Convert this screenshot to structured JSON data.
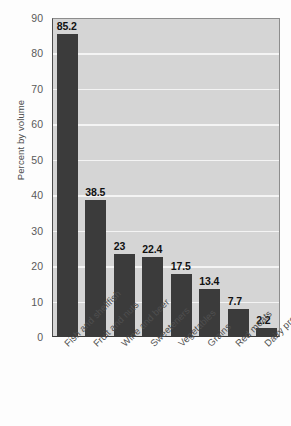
{
  "chart_data": {
    "type": "bar",
    "title": "",
    "xlabel": "",
    "ylabel": "Percent by volume",
    "ylim": [
      0,
      90
    ],
    "ytick_step": 10,
    "yticks": [
      90,
      80,
      70,
      60,
      50,
      40,
      30,
      20,
      10,
      0
    ],
    "grid": true,
    "legend": "none",
    "orientation": "vertical",
    "categories": [
      "Fish and shellfish",
      "Fruit and nuts",
      "Wine and beer",
      "Sweeteners",
      "Vegetables",
      "Grains",
      "Red meats",
      "Dairy products"
    ],
    "values": [
      85.2,
      38.5,
      23,
      22.4,
      17.5,
      13.4,
      7.7,
      2.2
    ],
    "data_labels": [
      "85.2",
      "38.5",
      "23",
      "22.4",
      "17.5",
      "13.4",
      "7.7",
      "2.2"
    ],
    "colors": {
      "bar": "#3b3b3b",
      "plot_background": "#d5d5d5",
      "gridline": "#f4f4f4",
      "axis": "#3a3a3a",
      "page_background": "#fdfdfd",
      "label_text": "#111111",
      "tick_text": "#5a5a5a"
    }
  }
}
